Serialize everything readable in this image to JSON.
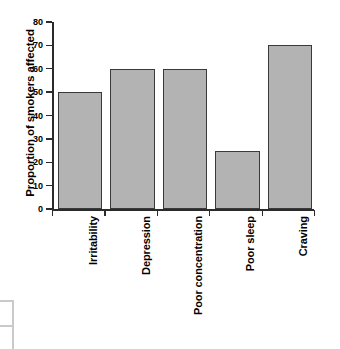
{
  "chart_data": {
    "type": "bar",
    "title": "",
    "subtitle": "",
    "xlabel": "",
    "ylabel": "Proportion of smokers affected",
    "categories": [
      "Irritability",
      "Depression",
      "Poor concentration",
      "Poor sleep",
      "Craving"
    ],
    "values": [
      50,
      60,
      60,
      25,
      70
    ],
    "series": [
      {
        "name": "Proportion of smokers affected",
        "values": [
          50,
          60,
          60,
          25,
          70
        ]
      }
    ],
    "ylim": [
      0,
      80
    ],
    "ytick_labels": [
      "0",
      "10",
      "20",
      "30",
      "40",
      "50",
      "60",
      "70",
      "80"
    ],
    "ytick_values": [
      0,
      10,
      20,
      30,
      40,
      50,
      60,
      70,
      80
    ],
    "grid": false,
    "legend": null,
    "legend_position": "none",
    "bar_color": "#b3b3b3",
    "bar_edge_color": "#3a3a3a",
    "axis_color": "#2b2b2b",
    "background_color": "#ffffff"
  }
}
